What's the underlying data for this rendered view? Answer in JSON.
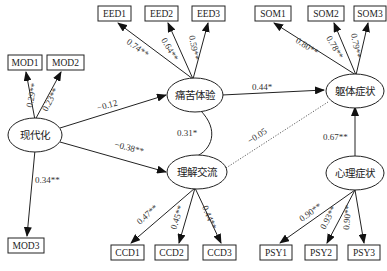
{
  "diagram": {
    "type": "structural-equation-model",
    "latent": {
      "modernization": "现代化",
      "pain_experience": "痛苦体验",
      "understanding": "理解交流",
      "somatic": "躯体症状",
      "psychological": "心理症状"
    },
    "observed": {
      "mod1": "MOD1",
      "mod2": "MOD2",
      "mod3": "MOD3",
      "eed1": "EED1",
      "eed2": "EED2",
      "eed3": "EED3",
      "ccd1": "CCD1",
      "ccd2": "CCD2",
      "ccd3": "CCD3",
      "som1": "SOM1",
      "som2": "SOM2",
      "som3": "SOM3",
      "psy1": "PSY1",
      "psy2": "PSY2",
      "psy3": "PSY3"
    },
    "loadings": {
      "mod1": "0.29**",
      "mod2": "0.23**",
      "mod3": "0.34**",
      "eed1": "0.74**",
      "eed2": "0.64**",
      "eed3": "0.59**",
      "ccd1": "0.47**",
      "ccd2": "0.45**",
      "ccd3": "0.44**",
      "som1": "0.80**",
      "som2": "0.78**",
      "som3": "0.79**",
      "psy1": "0.90**",
      "psy2": "0.93**",
      "psy3": "0.90**"
    },
    "paths": {
      "mod_to_pain": "−0.12",
      "mod_to_understanding": "−0.38**",
      "pain_understanding_cov": "0.31*",
      "pain_to_somatic": "0.44*",
      "understanding_to_somatic": "−0.05",
      "psych_to_somatic": "0.67**"
    }
  }
}
